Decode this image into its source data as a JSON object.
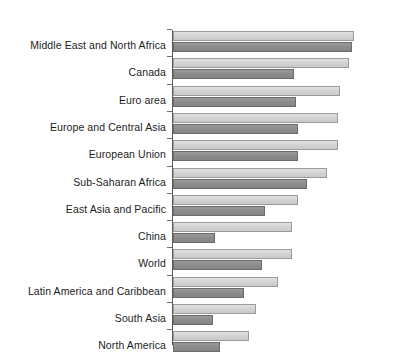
{
  "chart_data": {
    "type": "bar",
    "orientation": "horizontal",
    "title": "",
    "subtitle": "",
    "xlabel": "",
    "ylabel": "",
    "grid": false,
    "legend": "none",
    "axis_line": true,
    "ticks_visible": true,
    "xlim": [
      0,
      100
    ],
    "categories": [
      "Middle East and North Africa",
      "Canada",
      "Euro area",
      "Europe and Central Asia",
      "European Union",
      "Sub-Saharan Africa",
      "East Asia and Pacific",
      "China",
      "World",
      "Latin America and Caribbean",
      "South Asia",
      "North America"
    ],
    "series": [
      {
        "name": "series-light",
        "color": "#d4d4d4",
        "values": [
          100,
          97,
          92,
          91,
          91,
          85,
          69,
          66,
          66,
          58,
          46,
          42
        ]
      },
      {
        "name": "series-dark",
        "color": "#8d8d8d",
        "values": [
          99,
          67,
          68,
          69,
          69,
          74,
          51,
          23,
          49,
          39,
          22,
          26
        ]
      }
    ]
  },
  "colors": {
    "light_bar_fill": "#d4d4d4",
    "light_bar_border": "#9b9b9b",
    "dark_bar_fill": "#8d8d8d",
    "dark_bar_border": "#6b6b6b",
    "axis": "#5a5a5a",
    "text": "#1c1c1c",
    "background": "#ffffff"
  }
}
